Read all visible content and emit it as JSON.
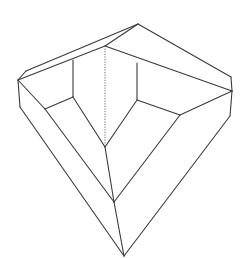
{
  "figure": {
    "stroke_color": "#3a3a3a",
    "background": "#ffffff",
    "vertices": {
      "apex_top": [
        138,
        24
      ],
      "left_knee": [
        26,
        71
      ],
      "left_outer": [
        18,
        80
      ],
      "left_lower": [
        20,
        107
      ],
      "inner_left_top": [
        73,
        60
      ],
      "inner_back_top": [
        105,
        46
      ],
      "inner_right_top": [
        137,
        63
      ],
      "right_knee": [
        231,
        77
      ],
      "right_outer": [
        232,
        91
      ],
      "right_lower": [
        230,
        116
      ],
      "inner_left_bottom": [
        45,
        109
      ],
      "inner_back_bottom": [
        73,
        97
      ],
      "inner_center_bottom": [
        105,
        147
      ],
      "inner_right_bottom": [
        137,
        100
      ],
      "inner_right_corner": [
        180,
        115
      ],
      "mid_lower": [
        114,
        202
      ],
      "apex_bottom": [
        124,
        256
      ]
    },
    "solid_edges": [
      [
        "left_outer",
        "left_knee"
      ],
      [
        "left_knee",
        "apex_top"
      ],
      [
        "apex_top",
        "right_knee"
      ],
      [
        "right_knee",
        "right_outer"
      ],
      [
        "right_outer",
        "right_lower"
      ],
      [
        "left_outer",
        "left_lower"
      ],
      [
        "apex_top",
        "inner_back_top"
      ],
      [
        "left_outer",
        "inner_back_top"
      ],
      [
        "inner_back_top",
        "right_outer"
      ],
      [
        "inner_left_top",
        "inner_back_bottom"
      ],
      [
        "inner_right_top",
        "inner_right_bottom"
      ],
      [
        "left_outer",
        "inner_left_bottom"
      ],
      [
        "inner_left_bottom",
        "inner_back_bottom"
      ],
      [
        "inner_back_bottom",
        "inner_center_bottom"
      ],
      [
        "inner_right_bottom",
        "inner_center_bottom"
      ],
      [
        "inner_right_bottom",
        "inner_right_corner"
      ],
      [
        "inner_right_corner",
        "right_outer"
      ],
      [
        "inner_center_bottom",
        "mid_lower"
      ],
      [
        "inner_left_bottom",
        "mid_lower"
      ],
      [
        "inner_right_corner",
        "mid_lower"
      ],
      [
        "left_lower",
        "apex_bottom"
      ],
      [
        "mid_lower",
        "apex_bottom"
      ],
      [
        "right_lower",
        "apex_bottom"
      ]
    ],
    "hidden_edges": [
      [
        "inner_back_top",
        "inner_center_bottom"
      ]
    ]
  }
}
